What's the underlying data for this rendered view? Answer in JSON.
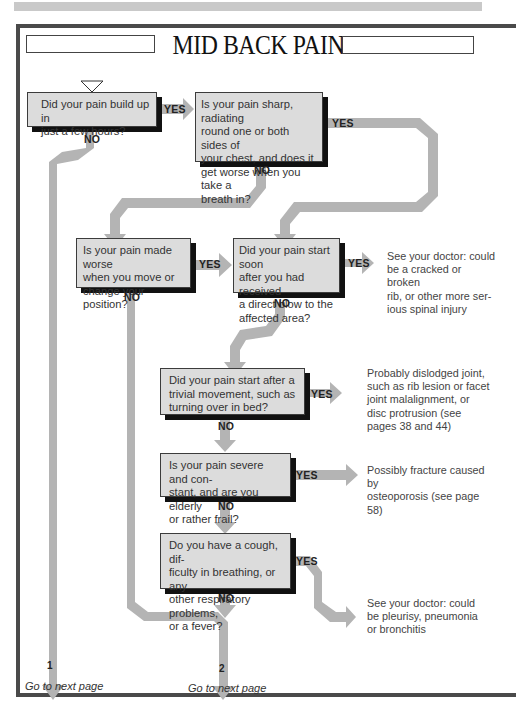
{
  "header": {
    "title": "MID BACK PAIN"
  },
  "questions": [
    {
      "id": "q1",
      "text": "Did your pain build up in just a few hours?"
    },
    {
      "id": "q2",
      "text": "Is your pain sharp, radiating round one or both sides of your chest, and does it get worse when you take a breath in?"
    },
    {
      "id": "q3",
      "text": "Is your pain made worse when you move or change your position?"
    },
    {
      "id": "q4",
      "text": "Did your pain start soon after you had received a direct blow to the affected area?"
    },
    {
      "id": "q5",
      "text": "Did your pain start after a trivial movement, such as turning over in bed?"
    },
    {
      "id": "q6",
      "text": "Is your pain severe and constant, and are you elderly or rather frail?"
    },
    {
      "id": "q7",
      "text": "Do you have a cough, difficulty in breathing, or any other respiratory problems, or a fever?"
    }
  ],
  "question_lines": {
    "q1": [
      "Did your pain build up in",
      "just a few hours?"
    ],
    "q2": [
      "Is your pain sharp, radiating",
      "round one or both sides of",
      "your chest, and does it",
      "get worse when you take a",
      "breath in?"
    ],
    "q3": [
      "Is your pain made worse",
      "when you move or",
      "change your position?"
    ],
    "q4": [
      "Did your pain start soon",
      "after you had received",
      "a direct blow to the",
      "affected area?"
    ],
    "q5": [
      "Did your pain start after a",
      "trivial movement, such as",
      "turning over in bed?"
    ],
    "q6": [
      "Is your pain severe and con-",
      "stant, and are you elderly",
      "or rather frail?"
    ],
    "q7": [
      "Do you have a cough, dif-",
      "ficulty in breathing, or any",
      "other respiratory problems,",
      "or a fever?"
    ]
  },
  "outcomes": {
    "o_blow": [
      "See your doctor: could",
      "be a cracked or broken",
      "rib, or other more ser-",
      "ious spinal injury"
    ],
    "o_joint": [
      "Probably dislodged joint,",
      "such as rib lesion or facet",
      "joint malalignment, or",
      "disc protrusion (see",
      "pages 38 and 44)"
    ],
    "o_fracture": [
      "Possibly fracture caused by",
      "osteoporosis (see page 58)"
    ],
    "o_resp": [
      "See your doctor: could",
      "be pleurisy, pneumonia",
      "or bronchitis"
    ]
  },
  "labels": {
    "yes": "YES",
    "no": "NO"
  },
  "exits": [
    {
      "number": "1",
      "text": "Go to next page"
    },
    {
      "number": "2",
      "text": "Go to next page"
    }
  ],
  "colors": {
    "box_fill": "#dcdcdc",
    "arrow_fill": "#b4b4b4",
    "shadow": "#111111",
    "frame": "#4a4a4a"
  }
}
